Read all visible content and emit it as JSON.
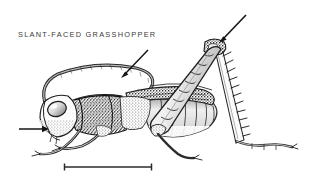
{
  "figure": {
    "subject": "slant-faced grasshopper",
    "style": "engraving",
    "background_color": "#ffffff",
    "ink_color": "#2b2b2b",
    "label": {
      "text": "SLANT-FACED GRASSHOPPER",
      "color": "#3b3b3b"
    },
    "annotations": [
      {
        "name": "antenna",
        "from": [
          148,
          50
        ],
        "to": [
          121,
          78
        ]
      },
      {
        "name": "hind-knee",
        "from": [
          246,
          15
        ],
        "to": [
          219,
          43
        ]
      },
      {
        "name": "head",
        "from": [
          19,
          129
        ],
        "to": [
          49,
          129
        ]
      }
    ],
    "scale_bar": {
      "x1": 64,
      "x2": 152,
      "y": 167,
      "color": "#2b2b2b"
    }
  }
}
